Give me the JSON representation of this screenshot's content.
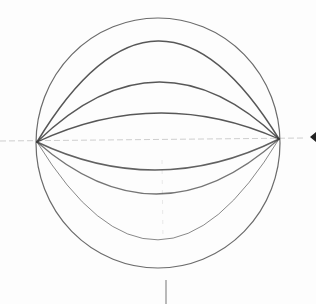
{
  "drawing": {
    "subject": "pencil sketch of a sphere with curved latitude-like arcs",
    "stroke_color": "#3a3a3a",
    "guide_color": "#9a9a9a",
    "background": "#fdfdfd",
    "sphere": {
      "cx": 158,
      "cy": 143,
      "rx": 122,
      "ry": 125
    },
    "left_pole": {
      "x": 37,
      "y": 142
    },
    "right_pole": {
      "x": 279,
      "y": 139
    },
    "arcs_above": [
      41,
      82,
      113
    ],
    "arcs_below": [
      170,
      194,
      240
    ],
    "horizontal_guide": {
      "y": 141,
      "x1": 0,
      "x2": 305
    },
    "vertical_guide": {
      "x": 166,
      "y1": 280,
      "y2": 304
    },
    "arrow_marker": {
      "x": 316,
      "y": 137,
      "direction": "left"
    }
  }
}
